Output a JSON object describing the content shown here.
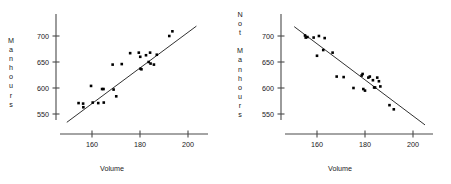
{
  "figure": {
    "background_color": "#ffffff",
    "axis_color": "#4a4a4a",
    "point_color": "#000000",
    "line_color": "#1a1a1a",
    "text_color": "#1a1a1a",
    "caption": ""
  },
  "panels": [
    {
      "id": "left",
      "ylabel_letters": "M\na\nn\nh\no\nu\nr\ns",
      "ylabel_text": "Manhours",
      "xlabel": "Volume",
      "ytick_labels": [
        "700",
        "650",
        "600",
        "550"
      ],
      "xtick_labels": [
        "160",
        "180",
        "200"
      ]
    },
    {
      "id": "right",
      "ylabel_letters": "N\no\nt\n \nM\na\nn\nh\no\nu\nr\ns",
      "ylabel_text": "Not Manhours",
      "xlabel": "Volume",
      "ytick_labels": [
        "700",
        "650",
        "600",
        "550"
      ],
      "xtick_labels": [
        "160",
        "180",
        "200"
      ]
    }
  ],
  "chart_data": [
    {
      "type": "scatter",
      "id": "left-scatter",
      "title": "",
      "xlabel": "Volume",
      "ylabel": "Manhours",
      "xlim": [
        148,
        206
      ],
      "ylim": [
        528,
        716
      ],
      "xticks": [
        160,
        180,
        200
      ],
      "yticks": [
        550,
        600,
        650,
        700
      ],
      "grid": false,
      "legend": "none",
      "trendline": {
        "description": "positive linear fit drawn across plot",
        "x": [
          149.5,
          203.5
        ],
        "y": [
          534,
          719
        ],
        "slope": 3.43,
        "intercept": 21.0
      },
      "points": [
        {
          "x": 154.4,
          "y": 571
        },
        {
          "x": 156.3,
          "y": 570
        },
        {
          "x": 156.4,
          "y": 563
        },
        {
          "x": 159.6,
          "y": 604
        },
        {
          "x": 160.3,
          "y": 572
        },
        {
          "x": 162.6,
          "y": 571
        },
        {
          "x": 164.2,
          "y": 598
        },
        {
          "x": 164.8,
          "y": 598
        },
        {
          "x": 164.9,
          "y": 572
        },
        {
          "x": 168.6,
          "y": 645
        },
        {
          "x": 169.0,
          "y": 597
        },
        {
          "x": 170.1,
          "y": 584
        },
        {
          "x": 172.4,
          "y": 646
        },
        {
          "x": 175.9,
          "y": 667
        },
        {
          "x": 179.5,
          "y": 668
        },
        {
          "x": 180.1,
          "y": 660
        },
        {
          "x": 180.2,
          "y": 637
        },
        {
          "x": 180.6,
          "y": 636
        },
        {
          "x": 182.5,
          "y": 663
        },
        {
          "x": 183.6,
          "y": 650
        },
        {
          "x": 184.2,
          "y": 668
        },
        {
          "x": 184.4,
          "y": 647
        },
        {
          "x": 185.8,
          "y": 645
        },
        {
          "x": 187.0,
          "y": 664
        },
        {
          "x": 192.2,
          "y": 700
        },
        {
          "x": 193.5,
          "y": 709
        }
      ]
    },
    {
      "type": "scatter",
      "id": "right-scatter",
      "title": "",
      "xlabel": "Volume",
      "ylabel": "Not Manhours",
      "xlim": [
        148,
        206
      ],
      "ylim": [
        528,
        716
      ],
      "xticks": [
        160,
        180,
        200
      ],
      "yticks": [
        550,
        600,
        650,
        700
      ],
      "grid": false,
      "legend": "none",
      "trendline": {
        "description": "negative linear fit drawn across plot",
        "x": [
          150.5,
          205.0
        ],
        "y": [
          718,
          529
        ],
        "slope": -3.47,
        "intercept": 1240.0
      },
      "points": [
        {
          "x": 155.0,
          "y": 701
        },
        {
          "x": 155.3,
          "y": 697
        },
        {
          "x": 156.0,
          "y": 698
        },
        {
          "x": 158.6,
          "y": 697
        },
        {
          "x": 160.0,
          "y": 662
        },
        {
          "x": 160.8,
          "y": 700
        },
        {
          "x": 162.6,
          "y": 673
        },
        {
          "x": 163.2,
          "y": 696
        },
        {
          "x": 166.5,
          "y": 668
        },
        {
          "x": 168.2,
          "y": 622
        },
        {
          "x": 171.1,
          "y": 621
        },
        {
          "x": 175.2,
          "y": 600
        },
        {
          "x": 178.6,
          "y": 624
        },
        {
          "x": 179.0,
          "y": 627
        },
        {
          "x": 179.3,
          "y": 598
        },
        {
          "x": 180.0,
          "y": 595
        },
        {
          "x": 181.4,
          "y": 620
        },
        {
          "x": 182.0,
          "y": 622
        },
        {
          "x": 183.3,
          "y": 615
        },
        {
          "x": 183.8,
          "y": 601
        },
        {
          "x": 184.2,
          "y": 601
        },
        {
          "x": 185.1,
          "y": 620
        },
        {
          "x": 185.8,
          "y": 613
        },
        {
          "x": 186.4,
          "y": 603
        },
        {
          "x": 190.2,
          "y": 567
        },
        {
          "x": 192.0,
          "y": 559
        }
      ]
    }
  ]
}
